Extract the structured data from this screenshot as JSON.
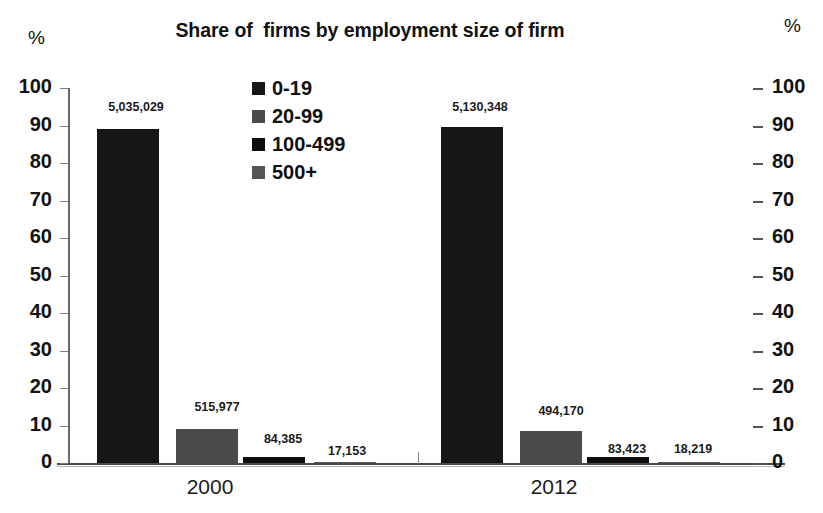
{
  "title": "Share of  firms by employment size of firm",
  "axis_unit_left": "%",
  "axis_unit_right": "%",
  "legend": {
    "items": [
      {
        "label": "0-19",
        "color": "#161616",
        "icon": "legend-swatch-icon"
      },
      {
        "label": "20-99",
        "color": "#4b4b4b",
        "icon": "legend-swatch-icon"
      },
      {
        "label": "100-499",
        "color": "#0d0d0d",
        "icon": "legend-swatch-icon"
      },
      {
        "label": "500+",
        "color": "#555555",
        "icon": "legend-swatch-icon"
      }
    ]
  },
  "y_ticks": [
    "100",
    "90",
    "80",
    "70",
    "60",
    "50",
    "40",
    "30",
    "20",
    "10",
    "0"
  ],
  "y_ticks_right": [
    "100",
    "90",
    "80",
    "70",
    "60",
    "50",
    "40",
    "30",
    "20",
    "10",
    "0"
  ],
  "categories": [
    "2000",
    "2012"
  ],
  "bar_labels": {
    "g2000": [
      "5,035,029",
      "515,977",
      "84,385",
      "17,153"
    ],
    "g2012": [
      "5,130,348",
      "494,170",
      "83,423",
      "18,219"
    ]
  },
  "chart_data": {
    "type": "bar",
    "title": "Share of  firms by employment size of firm",
    "xlabel": "",
    "ylabel": "%",
    "ylim": [
      0,
      100
    ],
    "ytick_step": 10,
    "grid": false,
    "legend_position": "inside-top-center",
    "dual_axis": true,
    "categories": [
      "2000",
      "2012"
    ],
    "series": [
      {
        "name": "0-19",
        "color": "#161616",
        "values": [
          89.1,
          89.6
        ],
        "counts": [
          5035029,
          5130348
        ],
        "count_labels": [
          "5,035,029",
          "5,130,348"
        ]
      },
      {
        "name": "20-99",
        "color": "#4b4b4b",
        "values": [
          9.1,
          8.6
        ],
        "counts": [
          515977,
          494170
        ],
        "count_labels": [
          "515,977",
          "494,170"
        ]
      },
      {
        "name": "100-499",
        "color": "#0d0d0d",
        "values": [
          1.5,
          1.5
        ],
        "counts": [
          84385,
          83423
        ],
        "count_labels": [
          "84,385",
          "83,423"
        ]
      },
      {
        "name": "500+",
        "color": "#555555",
        "values": [
          0.3,
          0.3
        ],
        "counts": [
          17153,
          18219
        ],
        "count_labels": [
          "17,153",
          "18,219"
        ]
      }
    ]
  }
}
